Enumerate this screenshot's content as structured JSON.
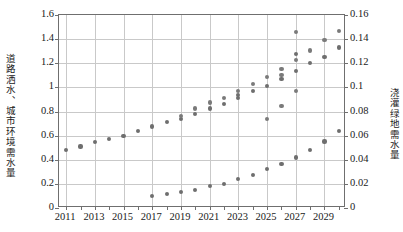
{
  "chart_data": {
    "type": "scatter",
    "title": "",
    "xlabel": "",
    "ylabel": "道路洒水、城市环境需水量",
    "y2label": "浇灌绿地需水量",
    "grid": true,
    "legend": "none",
    "xlim": [
      2010.5,
      2030.5
    ],
    "ylim": [
      0,
      1.6
    ],
    "y2lim": [
      0,
      0.16
    ],
    "x_tick_labels": [
      "2011",
      "2013",
      "2015",
      "2017",
      "2019",
      "2021",
      "2023",
      "2025",
      "2027",
      "2029"
    ],
    "x_tick_values": [
      2011,
      2013,
      2015,
      2017,
      2019,
      2021,
      2023,
      2025,
      2027,
      2029
    ],
    "x_minor_ticks": [
      2011,
      2012,
      2013,
      2014,
      2015,
      2016,
      2017,
      2018,
      2019,
      2020,
      2021,
      2022,
      2023,
      2024,
      2025,
      2026,
      2027,
      2028,
      2029,
      2030
    ],
    "y_tick_labels": [
      "0",
      "0.2",
      "0.4",
      "0.6",
      "0.8",
      "1",
      "1.2",
      "1.4",
      "1.6"
    ],
    "y_tick_values": [
      0,
      0.2,
      0.4,
      0.6,
      0.8,
      1.0,
      1.2,
      1.4,
      1.6
    ],
    "y2_tick_labels": [
      "0",
      "0.02",
      "0.04",
      "0.06",
      "0.08",
      "0.1",
      "0.12",
      "0.14",
      "0.16"
    ],
    "y2_tick_values": [
      0,
      0.02,
      0.04,
      0.06,
      0.08,
      0.1,
      0.12,
      0.14,
      0.16
    ],
    "marker_color": "#6e6e6e",
    "grid_color": "#c9c9c9",
    "frame_color": "#6f6f6f",
    "series": [
      {
        "name": "道路洒水、城市环境需水量 (方案A)",
        "axis": "left",
        "x": [
          2011,
          2012,
          2013,
          2014,
          2015,
          2016,
          2017,
          2018,
          2019,
          2020,
          2021,
          2022,
          2023,
          2024,
          2025,
          2026,
          2027,
          2028,
          2029,
          2030
        ],
        "values": [
          0.48,
          0.51,
          0.545,
          0.57,
          0.6,
          0.635,
          0.675,
          0.715,
          0.74,
          0.78,
          0.825,
          0.865,
          0.915,
          0.97,
          1.01,
          1.07,
          1.135,
          1.2,
          1.25,
          1.33
        ]
      },
      {
        "name": "道路洒水、城市环境需水量 (方案B)",
        "axis": "left",
        "x": [
          2019,
          2020,
          2021,
          2022,
          2023,
          2024,
          2025,
          2026,
          2027,
          2028,
          2029,
          2030
        ],
        "values": [
          0.765,
          0.825,
          0.875,
          0.915,
          0.97,
          1.03,
          1.085,
          1.155,
          1.225,
          1.305,
          1.39,
          1.47
        ]
      },
      {
        "name": "道路洒水、城市环境需水量 (方案C)",
        "axis": "left",
        "x": [
          2023,
          2027
        ],
        "values": [
          0.94,
          1.275
        ]
      },
      {
        "name": "道路洒水、城市环境需水量 (方案D)",
        "axis": "left",
        "x": [
          2026,
          2027
        ],
        "values": [
          1.1,
          1.46
        ]
      },
      {
        "name": "浇灌绿地需水量",
        "axis": "right",
        "x": [
          2017,
          2018,
          2019,
          2020,
          2021,
          2022,
          2023,
          2024,
          2025,
          2026,
          2027,
          2028,
          2029,
          2030
        ],
        "values": [
          0.0098,
          0.0113,
          0.0133,
          0.0152,
          0.018,
          0.02,
          0.0243,
          0.0275,
          0.032,
          0.0362,
          0.0418,
          0.0482,
          0.0552,
          0.0635
        ]
      },
      {
        "name": "浇灌绿地需水量 (延伸)",
        "axis": "right",
        "x": [
          2025,
          2026,
          2027
        ],
        "values": [
          0.0738,
          0.0845,
          0.0968
        ]
      }
    ]
  }
}
